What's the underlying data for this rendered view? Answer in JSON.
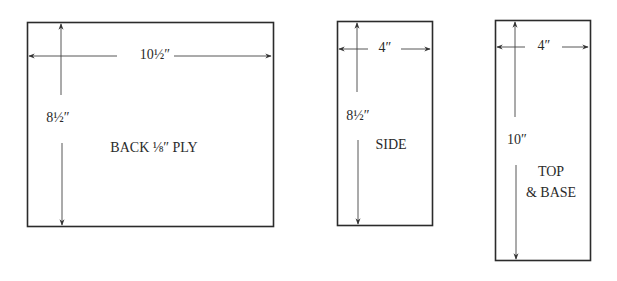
{
  "diagram": {
    "type": "cut-list panel drawing",
    "panels": [
      {
        "id": "back",
        "name": "BACK ⅛″ PLY",
        "width_label": "10½″",
        "height_label": "8½″"
      },
      {
        "id": "side",
        "name": "SIDE",
        "width_label": "4″",
        "height_label": "8½″"
      },
      {
        "id": "top-base",
        "name_line1": "TOP",
        "name_line2": "& BASE",
        "width_label": "4″",
        "height_label": "10″"
      }
    ]
  },
  "colors": {
    "line": "#2b2b2b",
    "text": "#2a2a2a",
    "background": "#ffffff"
  }
}
